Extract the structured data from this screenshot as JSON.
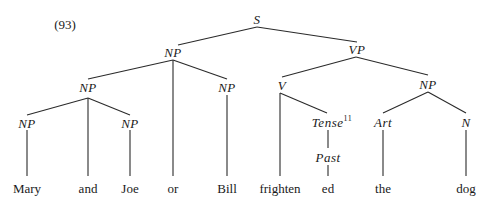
{
  "example_number": "(93)",
  "nodes": {
    "s": "S",
    "np_subject": "NP",
    "vp": "VP",
    "np_conj_left": "NP",
    "np_bill": "NP",
    "v": "V",
    "np_object": "NP",
    "np_mary": "NP",
    "np_joe": "NP",
    "tense": "Tense",
    "tense_footnote": "11",
    "art": "Art",
    "n": "N",
    "past": "Past"
  },
  "words": {
    "mary": "Mary",
    "and": "and",
    "joe": "Joe",
    "or": "or",
    "bill": "Bill",
    "frighten": "frighten",
    "ed": "ed",
    "the": "the",
    "dog": "dog"
  }
}
